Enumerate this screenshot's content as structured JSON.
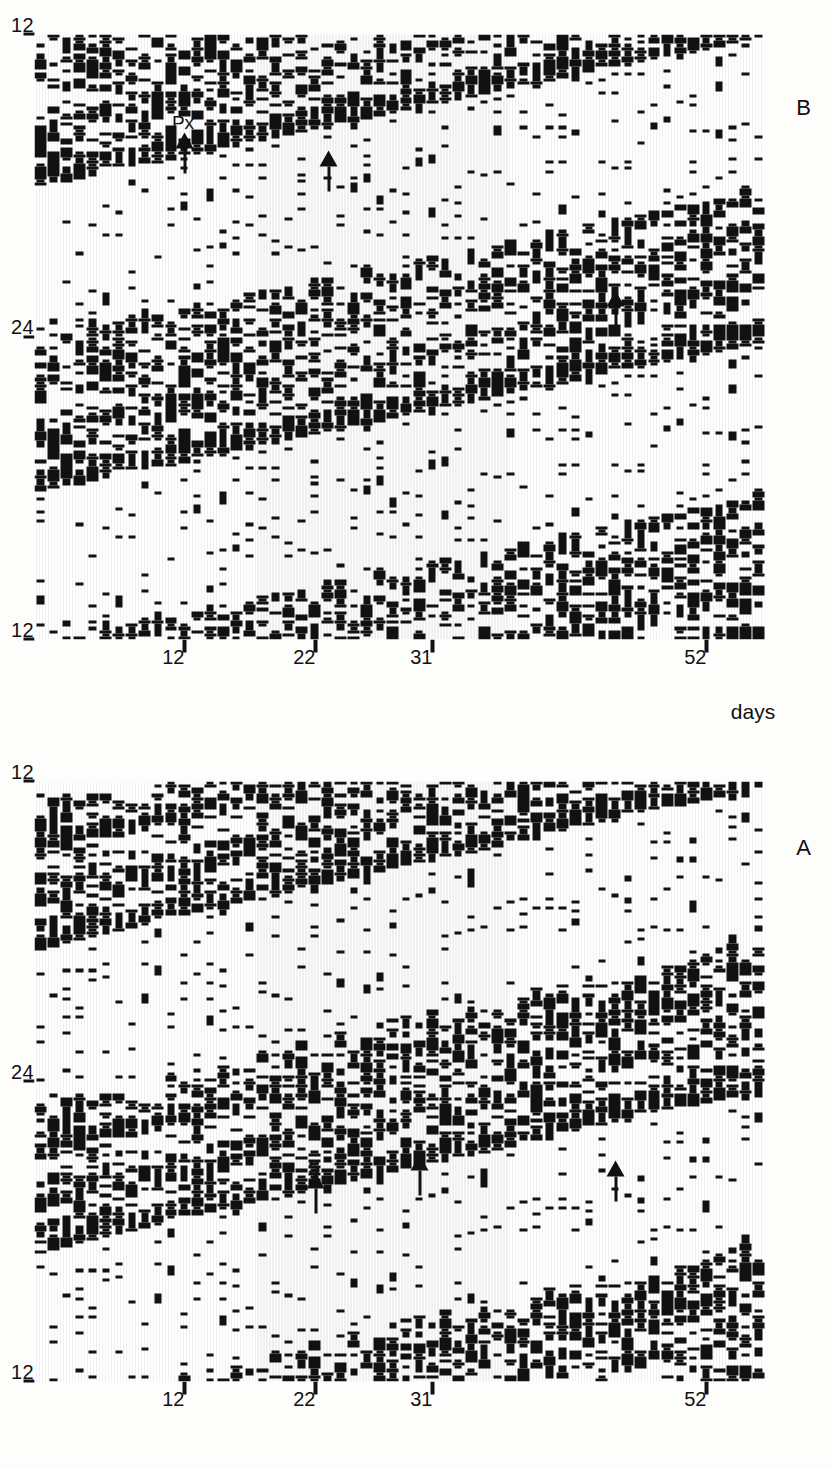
{
  "figure": {
    "kind": "double-plotted-actogram",
    "background_color": "#fdfdfc",
    "ink_color": "#111111",
    "orientation": "rotated-90-ccw",
    "axis_titles": {
      "days": "days"
    },
    "panels": [
      {
        "id": "A",
        "letter": "A",
        "hour_labels": [
          "12",
          "24",
          "12"
        ],
        "hour_tick_positions_pct": [
          0,
          50,
          100
        ],
        "day_labels": [
          "12",
          "22",
          "31",
          "52"
        ],
        "day_tick_values": [
          12,
          22,
          31,
          52
        ],
        "annotations": [
          {
            "name": "s-marker",
            "label": "S",
            "day": 22,
            "hour_pct": 33.0
          },
          {
            "name": "arrow-marker-1",
            "label": "",
            "day": 30,
            "hour_pct": 36.0
          },
          {
            "name": "arrow-marker-2",
            "label": "",
            "day": 45,
            "hour_pct": 35.0
          }
        ]
      },
      {
        "id": "B",
        "letter": "B",
        "hour_labels": [
          "12",
          "24",
          "12"
        ],
        "hour_tick_positions_pct": [
          0,
          50,
          100
        ],
        "day_labels": [
          "12",
          "22",
          "31",
          "52"
        ],
        "day_tick_values": [
          12,
          22,
          31,
          52
        ],
        "annotations": [
          {
            "name": "px-marker",
            "label": "Px",
            "day": 12,
            "hour_pct": 82.0
          },
          {
            "name": "arrow-marker-1",
            "label": "",
            "day": 23,
            "hour_pct": 79.0
          },
          {
            "name": "arrow-marker-2",
            "label": "",
            "day": 45,
            "hour_pct": 56.0
          }
        ]
      }
    ]
  },
  "chart_data": {
    "type": "heatmap",
    "subtype": "actogram-raster",
    "title": "",
    "xlabel": "",
    "ylabel": "days",
    "xlim": [
      12,
      36
    ],
    "ylim": [
      1,
      56
    ],
    "xticks": [
      12,
      24,
      36
    ],
    "xticklabels": [
      "12",
      "24",
      "12"
    ],
    "yticks": [
      12,
      22,
      31,
      52
    ],
    "yticklabels": [
      "12",
      "22",
      "31",
      "52"
    ],
    "grid": false,
    "legend": null,
    "panel_labels": [
      "A",
      "B"
    ],
    "annotations": [
      {
        "panel": "A",
        "text": "S",
        "day": 22
      },
      {
        "panel": "A",
        "text": "",
        "day": 30
      },
      {
        "panel": "A",
        "text": "",
        "day": 45
      },
      {
        "panel": "B",
        "text": "Px",
        "day": 12
      },
      {
        "panel": "B",
        "text": "",
        "day": 23
      },
      {
        "panel": "B",
        "text": "",
        "day": 45
      }
    ],
    "series": [
      {
        "name": "panel-A-activity",
        "n_days": 56,
        "hours_per_row": 48,
        "bin_minutes": 15
      },
      {
        "name": "panel-B-activity",
        "n_days": 56,
        "hours_per_row": 48,
        "bin_minutes": 15
      }
    ]
  }
}
